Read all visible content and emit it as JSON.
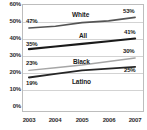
{
  "chart_data": {
    "type": "line",
    "title": "",
    "xlabel": "",
    "ylabel": "",
    "x": [
      "2003",
      "2004",
      "2005",
      "2006",
      "2007"
    ],
    "categories": [
      "2003",
      "2004",
      "2005",
      "2006",
      "2007"
    ],
    "ylim": [
      0,
      60
    ],
    "yticks": [
      0,
      10,
      20,
      30,
      40,
      50,
      60
    ],
    "ytick_labels": [
      "0%",
      "10%",
      "20%",
      "30%",
      "40%",
      "50%",
      "60%"
    ],
    "grid": true,
    "legend": "inline-series-labels",
    "series": [
      {
        "name": "White",
        "color": "#555555",
        "values": [
          47,
          48,
          50,
          51,
          53
        ],
        "start_label": "47%",
        "end_label": "53%"
      },
      {
        "name": "All",
        "color": "#1a1a1a",
        "values": [
          35,
          36.5,
          38,
          39.5,
          41
        ],
        "start_label": "35%",
        "end_label": "41%"
      },
      {
        "name": "Black",
        "color": "#a6a6a6",
        "values": [
          23,
          24.5,
          26,
          28,
          30
        ],
        "start_label": "23%",
        "end_label": "30%"
      },
      {
        "name": "Latino",
        "color": "#262626",
        "values": [
          19,
          21,
          23,
          24,
          25
        ],
        "start_label": "19%",
        "end_label": "25%"
      }
    ],
    "annotations": [
      {
        "text": "47%",
        "series": "White",
        "position": "start-above"
      },
      {
        "text": "53%",
        "series": "White",
        "position": "end-above"
      },
      {
        "text": "35%",
        "series": "All",
        "position": "start-above"
      },
      {
        "text": "41%",
        "series": "All",
        "position": "end-above"
      },
      {
        "text": "23%",
        "series": "Black",
        "position": "start-above"
      },
      {
        "text": "30%",
        "series": "Black",
        "position": "end-above"
      },
      {
        "text": "19%",
        "series": "Latino",
        "position": "start-below"
      },
      {
        "text": "25%",
        "series": "Latino",
        "position": "end-above"
      }
    ]
  },
  "axis": {
    "y_labels": [
      "60%",
      "50%",
      "40%",
      "30%",
      "20%",
      "10%",
      "0%"
    ],
    "x_labels": [
      "2003",
      "2004",
      "2005",
      "2006",
      "2007"
    ]
  },
  "series_labels": {
    "white": "White",
    "all": "All",
    "black": "Black",
    "latino": "Latino"
  },
  "point_labels": {
    "white_start": "47%",
    "white_end": "53%",
    "all_start": "35%",
    "all_end": "41%",
    "black_start": "23%",
    "black_end": "30%",
    "latino_start": "19%",
    "latino_end": "25%"
  }
}
